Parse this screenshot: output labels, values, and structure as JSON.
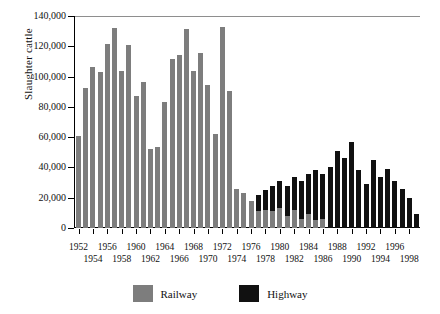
{
  "chart_data": {
    "type": "bar",
    "stacked": true,
    "title": "",
    "xlabel": "",
    "ylabel": "Slaughter cattle",
    "ylim": [
      0,
      140000
    ],
    "ytick_step": 20000,
    "ytick_labels": [
      "0",
      "20,000",
      "40,000",
      "60,000",
      "80,000",
      "100,000",
      "120,000",
      "140,000"
    ],
    "ytick_values": [
      0,
      20000,
      40000,
      60000,
      80000,
      100000,
      120000,
      140000
    ],
    "grid": false,
    "legend_position": "bottom",
    "categories": [
      "1952",
      "1953",
      "1954",
      "1955",
      "1956",
      "1957",
      "1958",
      "1959",
      "1960",
      "1961",
      "1962",
      "1963",
      "1964",
      "1965",
      "1966",
      "1967",
      "1968",
      "1969",
      "1970",
      "1971",
      "1972",
      "1973",
      "1974",
      "1975",
      "1976",
      "1977",
      "1978",
      "1979",
      "1980",
      "1981",
      "1982",
      "1983",
      "1984",
      "1985",
      "1986",
      "1987",
      "1988",
      "1989",
      "1990",
      "1991",
      "1992",
      "1993",
      "1994",
      "1995",
      "1996",
      "1997",
      "1998",
      "1999"
    ],
    "xtick_labels_row0": [
      "1952",
      "1956",
      "1960",
      "1964",
      "1968",
      "1972",
      "1976",
      "1980",
      "1984",
      "1988",
      "1992",
      "1996"
    ],
    "xtick_labels_row1": [
      "1954",
      "1958",
      "1962",
      "1966",
      "1970",
      "1974",
      "1978",
      "1982",
      "1986",
      "1990",
      "1994",
      "1998"
    ],
    "series": [
      {
        "name": "Railway",
        "color": "#7d7d7d",
        "values": [
          61000,
          92500,
          106500,
          103000,
          121500,
          132000,
          103500,
          121000,
          87000,
          96500,
          52000,
          53500,
          83500,
          111500,
          114500,
          131500,
          104000,
          115500,
          94500,
          62000,
          132500,
          90500,
          26000,
          23000,
          18000,
          11000,
          12000,
          11000,
          13000,
          8000,
          12000,
          6000,
          9000,
          5000,
          6000,
          0,
          0,
          0,
          0,
          0,
          0,
          0,
          0,
          0,
          0,
          0,
          0,
          0
        ]
      },
      {
        "name": "Highway",
        "color": "#111111",
        "values": [
          0,
          0,
          0,
          0,
          0,
          0,
          0,
          0,
          0,
          0,
          0,
          0,
          0,
          0,
          0,
          0,
          0,
          0,
          0,
          0,
          0,
          0,
          0,
          0,
          0,
          11000,
          13000,
          17000,
          18000,
          20000,
          22000,
          25000,
          27000,
          33000,
          30000,
          40000,
          51000,
          46000,
          57000,
          38000,
          29000,
          45000,
          34000,
          39000,
          31000,
          26000,
          20000,
          9000
        ]
      }
    ]
  },
  "legend": {
    "items": [
      {
        "label": "Railway",
        "color": "#7d7d7d",
        "swatch": "railway-swatch"
      },
      {
        "label": "Highway",
        "color": "#111111",
        "swatch": "highway-swatch"
      }
    ]
  },
  "axis": {
    "y_title": "Slaughter cattle"
  }
}
